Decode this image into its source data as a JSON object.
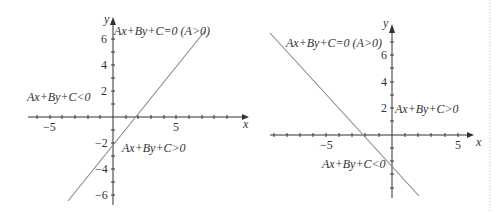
{
  "figure": {
    "left_panel": {
      "axis_x_label": "x",
      "axis_y_label": "y",
      "x_ticks": {
        "neg5": "−5",
        "pos5": "5"
      },
      "y_ticks": {
        "p6": "6",
        "p4": "4",
        "p2": "2",
        "n2": "−2",
        "n4": "−4",
        "n6": "−6"
      },
      "line_label": "Ax+By+C=0 (A>0)",
      "region_negative": "Ax+By+C<0",
      "region_positive": "Ax+By+C>0",
      "line_color": "#888888"
    },
    "right_panel": {
      "axis_x_label": "x",
      "axis_y_label": "y",
      "x_ticks": {
        "neg5": "−5",
        "pos5": "5"
      },
      "y_ticks": {
        "p6": "6",
        "p4": "4",
        "p2": "2"
      },
      "line_label": "Ax+By+C=0 (A>0)",
      "region_positive": "Ax+By+C>0",
      "region_negative": "Ax+By+C<0",
      "line_color": "#888888"
    }
  }
}
